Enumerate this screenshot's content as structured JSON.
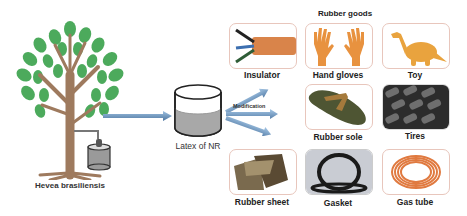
{
  "source": {
    "label": "Hevea brasiliensis"
  },
  "latex": {
    "label": "Latex of NR"
  },
  "process": {
    "label": "Modification"
  },
  "goods": {
    "title": "Rubber goods",
    "items": [
      {
        "label": "Insulator"
      },
      {
        "label": "Hand gloves"
      },
      {
        "label": "Toy"
      },
      {
        "label": "Rubber sole"
      },
      {
        "label": "Tires"
      },
      {
        "label": "Rubber sheet"
      },
      {
        "label": "Gasket"
      },
      {
        "label": "Gas tube"
      }
    ]
  },
  "colors": {
    "leaf": "#4caa5c",
    "trunk": "#9e7a5e",
    "arrow": "#6f98bf",
    "tile_border": "#e8c6bc",
    "rubber_orange": "#e59450"
  }
}
